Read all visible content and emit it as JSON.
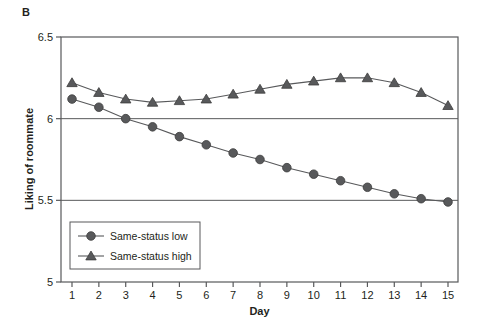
{
  "panel": {
    "label": "B"
  },
  "axes": {
    "ylabel": "Liking of roommate",
    "xlabel": "Day",
    "y_ticks": [
      "5",
      "5.5",
      "6",
      "6.5"
    ],
    "x_ticks": [
      "1",
      "2",
      "3",
      "4",
      "5",
      "6",
      "7",
      "8",
      "9",
      "10",
      "11",
      "12",
      "13",
      "14",
      "15"
    ]
  },
  "legend": {
    "items": [
      {
        "label": "Same-status low",
        "marker": "circle",
        "color": "#58595b"
      },
      {
        "label": "Same-status high",
        "marker": "triangle",
        "color": "#58595b"
      }
    ]
  },
  "chart_data": {
    "type": "line",
    "title": "B",
    "xlabel": "Day",
    "ylabel": "Liking of roommate",
    "x": [
      1,
      2,
      3,
      4,
      5,
      6,
      7,
      8,
      9,
      10,
      11,
      12,
      13,
      14,
      15
    ],
    "xlim": [
      0.5,
      15.5
    ],
    "ylim": [
      5,
      6.5
    ],
    "yticks": [
      5,
      5.5,
      6,
      6.5
    ],
    "grid": "horizontal-at-5.5-and-6",
    "legend_position": "lower-left-inside",
    "series": [
      {
        "name": "Same-status low",
        "marker": "circle",
        "color": "#58595b",
        "values": [
          6.12,
          6.07,
          6.0,
          5.95,
          5.89,
          5.84,
          5.79,
          5.75,
          5.7,
          5.66,
          5.62,
          5.58,
          5.54,
          5.51,
          5.49
        ]
      },
      {
        "name": "Same-status high",
        "marker": "triangle",
        "color": "#58595b",
        "values": [
          6.22,
          6.16,
          6.12,
          6.1,
          6.11,
          6.12,
          6.15,
          6.18,
          6.21,
          6.23,
          6.25,
          6.25,
          6.22,
          6.16,
          6.08
        ]
      }
    ]
  }
}
